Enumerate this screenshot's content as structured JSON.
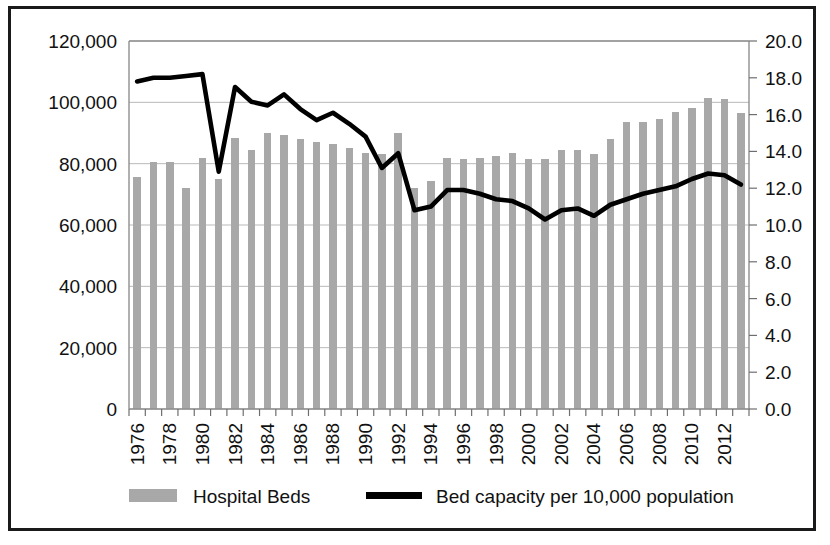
{
  "figure": {
    "border_color": "#1a1a1a",
    "background": "#ffffff"
  },
  "legend": {
    "items": [
      {
        "label": "Hospital Beds",
        "marker": "bar-swatch",
        "color": "#a8a8a8"
      },
      {
        "label": "Bed capacity per 10,000 population",
        "marker": "line-swatch",
        "color": "#000000"
      }
    ]
  },
  "chart_data": {
    "type": "bar",
    "title": "",
    "subtitle": "",
    "xlabel": "",
    "ylabel": "",
    "grid": true,
    "legend_position": "bottom",
    "x": [
      1976,
      1977,
      1978,
      1979,
      1980,
      1981,
      1982,
      1983,
      1984,
      1985,
      1986,
      1987,
      1988,
      1989,
      1990,
      1991,
      1992,
      1993,
      1994,
      1995,
      1996,
      1997,
      1998,
      1999,
      2000,
      2001,
      2002,
      2003,
      2004,
      2005,
      2006,
      2007,
      2008,
      2009,
      2010,
      2011,
      2012,
      2013
    ],
    "categories": [
      "1976",
      "1977",
      "1978",
      "1979",
      "1980",
      "1981",
      "1982",
      "1983",
      "1984",
      "1985",
      "1986",
      "1987",
      "1988",
      "1989",
      "1990",
      "1991",
      "1992",
      "1993",
      "1994",
      "1995",
      "1996",
      "1997",
      "1998",
      "1999",
      "2000",
      "2001",
      "2002",
      "2003",
      "2004",
      "2005",
      "2006",
      "2007",
      "2008",
      "2009",
      "2010",
      "2011",
      "2012",
      "2013"
    ],
    "xtick_labels": [
      "1976",
      "1978",
      "1980",
      "1982",
      "1984",
      "1986",
      "1988",
      "1990",
      "1992",
      "1994",
      "1996",
      "1998",
      "2000",
      "2002",
      "2004",
      "2006",
      "2008",
      "2010",
      "2012"
    ],
    "xtick_label_rotation": -90,
    "xtick_label_step": 2,
    "left_axis": {
      "label": "",
      "ylim": [
        0,
        120000
      ],
      "ticks": [
        0,
        20000,
        40000,
        60000,
        80000,
        100000,
        120000
      ],
      "tick_labels": [
        "0",
        "20,000",
        "40,000",
        "60,000",
        "80,000",
        "100,000",
        "120,000"
      ]
    },
    "right_axis": {
      "label": "",
      "ylim": [
        0,
        20
      ],
      "ticks": [
        0,
        2,
        4,
        6,
        8,
        10,
        12,
        14,
        16,
        18,
        20
      ],
      "tick_labels": [
        "0.0",
        "2.0",
        "4.0",
        "6.0",
        "8.0",
        "10.0",
        "12.0",
        "14.0",
        "16.0",
        "18.0",
        "20.0"
      ]
    },
    "series": [
      {
        "name": "Hospital Beds",
        "type": "bar",
        "axis": "left",
        "color": "#a8a8a8",
        "values": [
          75500,
          80500,
          80500,
          72000,
          82000,
          75000,
          88500,
          84500,
          90000,
          89500,
          88000,
          87000,
          86500,
          85000,
          83500,
          83000,
          90000,
          72000,
          74500,
          82000,
          81500,
          82000,
          82500,
          83500,
          81500,
          81500,
          84500,
          84500,
          83000,
          88000,
          93500,
          93500,
          94500,
          97000,
          98000,
          101500,
          101000,
          96500
        ]
      },
      {
        "name": "Bed capacity per 10,000 population",
        "type": "line",
        "axis": "right",
        "color": "#000000",
        "values": [
          17.8,
          18.0,
          18.0,
          18.1,
          18.2,
          12.9,
          17.5,
          16.7,
          16.5,
          17.1,
          16.3,
          15.7,
          16.1,
          15.5,
          14.8,
          13.1,
          13.9,
          10.8,
          11.0,
          11.9,
          11.9,
          11.7,
          11.4,
          11.3,
          10.9,
          10.3,
          10.8,
          10.9,
          10.5,
          11.1,
          11.4,
          11.7,
          11.9,
          12.1,
          12.5,
          12.8,
          12.7,
          12.2
        ]
      }
    ]
  }
}
